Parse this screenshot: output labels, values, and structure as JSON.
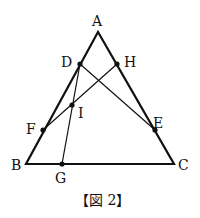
{
  "figure": {
    "caption": "【図 2】",
    "points": {
      "A": {
        "label": "A",
        "x": 98,
        "y": 32
      },
      "B": {
        "label": "B",
        "x": 26,
        "y": 164
      },
      "C": {
        "label": "C",
        "x": 174,
        "y": 164
      },
      "D": {
        "label": "D",
        "x": 80,
        "y": 64
      },
      "H": {
        "label": "H",
        "x": 117,
        "y": 64
      },
      "I": {
        "label": "I",
        "x": 72,
        "y": 105
      },
      "F": {
        "label": "F",
        "x": 43,
        "y": 130
      },
      "E": {
        "label": "E",
        "x": 155,
        "y": 130
      },
      "G": {
        "label": "G",
        "x": 62,
        "y": 164
      }
    },
    "segments": [
      "AB",
      "BC",
      "CA",
      "DE",
      "DG",
      "FH"
    ]
  }
}
